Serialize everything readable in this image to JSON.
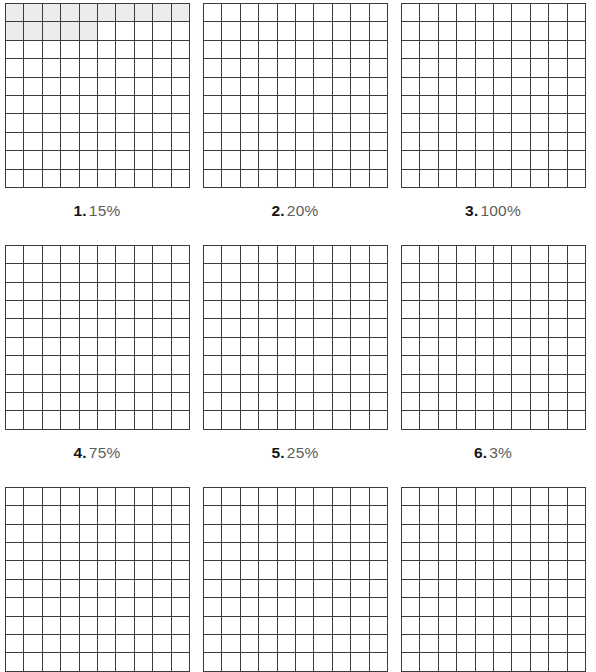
{
  "page": {
    "type": "percent-grid-worksheet",
    "grid_columns": 10,
    "grid_rows": 10,
    "colors": {
      "grid_line": "#3b3b3b",
      "shaded_cell": "#ececec",
      "page_background": "#ffffff",
      "label_number": "#151515",
      "label_percent": "#5d5d5d"
    }
  },
  "problems": [
    {
      "number": "1.",
      "percent": "15%",
      "shaded_cells": 15,
      "has_shading": true
    },
    {
      "number": "2.",
      "percent": "20%",
      "shaded_cells": 0,
      "has_shading": false
    },
    {
      "number": "3.",
      "percent": "100%",
      "shaded_cells": 0,
      "has_shading": false
    },
    {
      "number": "4.",
      "percent": "75%",
      "shaded_cells": 0,
      "has_shading": false
    },
    {
      "number": "5.",
      "percent": "25%",
      "shaded_cells": 0,
      "has_shading": false
    },
    {
      "number": "6.",
      "percent": "3%",
      "shaded_cells": 0,
      "has_shading": false
    },
    {
      "number": "",
      "percent": "",
      "shaded_cells": 0,
      "has_shading": false
    },
    {
      "number": "",
      "percent": "",
      "shaded_cells": 0,
      "has_shading": false
    },
    {
      "number": "",
      "percent": "",
      "shaded_cells": 0,
      "has_shading": false
    }
  ]
}
